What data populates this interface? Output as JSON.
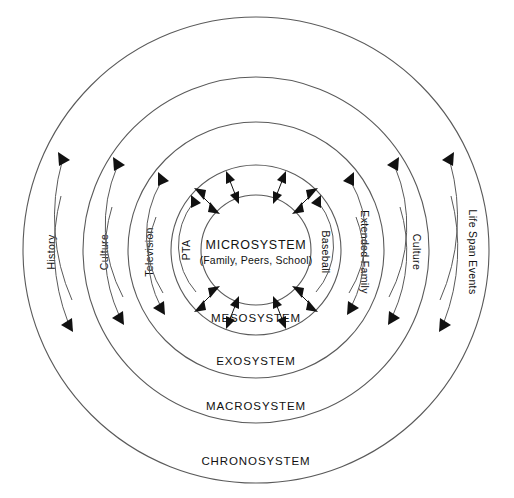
{
  "diagram": {
    "center": {
      "title": "MICROSYSTEM",
      "subtitle": "(Family, Peers, School)"
    },
    "rings": [
      {
        "id": "mesosystem",
        "label": "MESOSYSTEM",
        "radius": 85,
        "label_y": 322
      },
      {
        "id": "exosystem",
        "label": "EXOSYSTEM",
        "radius": 128,
        "label_y": 365
      },
      {
        "id": "macrosystem",
        "label": "MACROSYSTEM",
        "radius": 173,
        "label_y": 410
      },
      {
        "id": "chronosystem",
        "label": "CHRONOSYSTEM",
        "radius": 233,
        "label_y": 465
      }
    ],
    "inner_radius": 55,
    "center_x": 256,
    "center_y": 250,
    "side_labels_left": [
      {
        "id": "television",
        "text": "Television",
        "radius": 107
      },
      {
        "id": "culture-left",
        "text": "Culture",
        "radius": 152
      },
      {
        "id": "history",
        "text": "History",
        "radius": 205
      },
      {
        "id": "pta",
        "text": "PTA",
        "radius": 70
      }
    ],
    "side_labels_right": [
      {
        "id": "baseball",
        "text": "Baseball",
        "radius": 70
      },
      {
        "id": "extended-family",
        "text": "Extended Family",
        "radius": 107
      },
      {
        "id": "culture-right",
        "text": "Culture",
        "radius": 152
      },
      {
        "id": "life-span-events",
        "text": "Life Span Events",
        "radius": 205
      }
    ],
    "colors": {
      "stroke": "#5a5a5a",
      "text": "#111111",
      "background": "#ffffff",
      "arrow": "#111111"
    }
  }
}
